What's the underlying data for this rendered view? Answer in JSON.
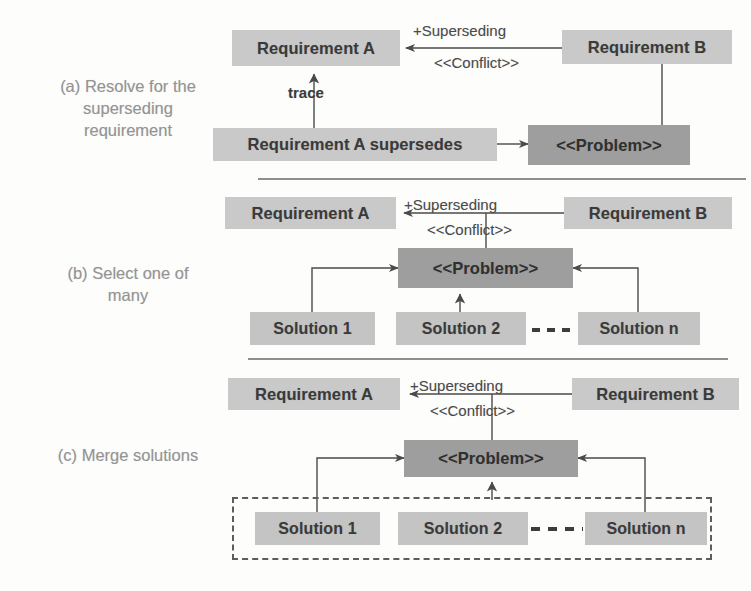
{
  "figure": {
    "background_color": "#fdfdfc",
    "box_fill": "#c9c9c9",
    "problem_fill": "#9e9e9e",
    "text_color": "#3a3a3a",
    "caption_color": "#949494",
    "line_color": "#5d5d5d"
  },
  "sections": [
    {
      "id": "a",
      "caption": "(a) Resolve for the superseding requirement",
      "caption_lines": [
        "(a) Resolve for the",
        "superseding",
        "requirement"
      ],
      "nodes": {
        "requirement_a": "Requirement A",
        "requirement_b": "Requirement B",
        "problem": "<<Problem>>",
        "supersedes": "Requirement A supersedes"
      },
      "edges": {
        "superseding": "+Superseding",
        "conflict": "<<Conflict>>",
        "trace": "trace"
      }
    },
    {
      "id": "b",
      "caption": "(b) Select one of many",
      "caption_lines": [
        "(b) Select one of",
        "many"
      ],
      "nodes": {
        "requirement_a": "Requirement A",
        "requirement_b": "Requirement B",
        "problem": "<<Problem>>",
        "solution_1": "Solution 1",
        "solution_2": "Solution 2",
        "solution_n": "Solution n"
      },
      "edges": {
        "superseding": "+Superseding",
        "conflict": "<<Conflict>>"
      }
    },
    {
      "id": "c",
      "caption": "(c) Merge solutions",
      "caption_lines": [
        "(c) Merge solutions"
      ],
      "nodes": {
        "requirement_a": "Requirement A",
        "requirement_b": "Requirement B",
        "problem": "<<Problem>>",
        "solution_1": "Solution 1",
        "solution_2": "Solution 2",
        "solution_n": "Solution n"
      },
      "edges": {
        "superseding": "+Superseding",
        "conflict": "<<Conflict>>"
      }
    }
  ]
}
